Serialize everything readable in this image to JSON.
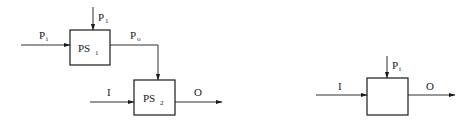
{
  "diagram": {
    "left": {
      "blocks": [
        {
          "id": "ps1",
          "label": "PS",
          "subscript": "1"
        },
        {
          "id": "ps2",
          "label": "PS",
          "subscript": "2"
        }
      ],
      "signals": {
        "p_in": {
          "label": "P",
          "subscript": "i"
        },
        "p_1": {
          "label": "P",
          "subscript": "1"
        },
        "p_out": {
          "label": "P",
          "subscript": "o"
        },
        "input": {
          "label": "I"
        },
        "output": {
          "label": "O"
        }
      }
    },
    "right": {
      "block": {
        "id": "process",
        "label": ""
      },
      "signals": {
        "p_param": {
          "label": "P",
          "subscript": "i"
        },
        "input": {
          "label": "I"
        },
        "output": {
          "label": "O"
        }
      }
    },
    "colors": {
      "line": "#1a1a1a",
      "background": "#ffffff"
    }
  }
}
